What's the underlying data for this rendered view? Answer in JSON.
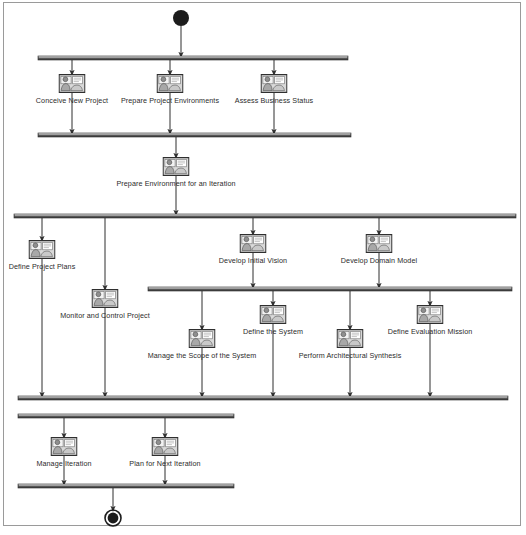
{
  "diagram": {
    "type": "uml-activity-diagram",
    "title": "",
    "colors": {
      "stroke": "#3a3a3a",
      "bar_fill": "#6e6e6e",
      "bar_highlight": "#cfcfcf",
      "node_fill": "#d6d6d6",
      "node_stroke": "#2f2f2f",
      "icon_accent": "#8f8f8f",
      "text": "#2b2b2b",
      "frame": "#9a9a9a",
      "initial_node": "#1c1c1c",
      "final_node": "#1c1c1c"
    },
    "initial_node": {
      "name": "initial-node",
      "cx": 181,
      "cy": 18,
      "r": 8
    },
    "final_node": {
      "name": "final-node",
      "cx": 113,
      "cy": 518,
      "r_outer": 8,
      "r_inner": 5.4
    },
    "bars": [
      {
        "id": "fork-1",
        "label": "fork-bar-1",
        "x1": 38,
        "x2": 348,
        "y": 56
      },
      {
        "id": "join-1",
        "label": "join-bar-1",
        "x1": 38,
        "x2": 351,
        "y": 133
      },
      {
        "id": "fork-2",
        "label": "fork-bar-2",
        "x1": 14,
        "x2": 516,
        "y": 214
      },
      {
        "id": "fork-3",
        "label": "fork-bar-3",
        "x1": 148,
        "x2": 512,
        "y": 287
      },
      {
        "id": "join-2",
        "label": "join-bar-2",
        "x1": 18,
        "x2": 508,
        "y": 396
      },
      {
        "id": "fork-4",
        "label": "fork-bar-4",
        "x1": 18,
        "x2": 234,
        "y": 414
      },
      {
        "id": "join-3",
        "label": "join-bar-3",
        "x1": 18,
        "x2": 234,
        "y": 484
      }
    ],
    "nodes": [
      {
        "id": "conceive-new-project",
        "label": "Conceive New Project",
        "cx": 72,
        "icon_y": 74,
        "label_y": 96
      },
      {
        "id": "prepare-project-environments",
        "label": "Prepare Project Environments",
        "cx": 170,
        "icon_y": 74,
        "label_y": 96
      },
      {
        "id": "assess-business-status",
        "label": "Assess Business Status",
        "cx": 274,
        "icon_y": 74,
        "label_y": 96
      },
      {
        "id": "prepare-environment-for-an-iteration",
        "label": "Prepare Environment for an Iteration",
        "cx": 176,
        "icon_y": 157,
        "label_y": 179
      },
      {
        "id": "define-project-plans",
        "label": "Define Project Plans",
        "cx": 42,
        "icon_y": 240,
        "label_y": 262
      },
      {
        "id": "develop-initial-vision",
        "label": "Develop Initial Vision",
        "cx": 253,
        "icon_y": 234,
        "label_y": 256
      },
      {
        "id": "develop-domain-model",
        "label": "Develop Domain Model",
        "cx": 379,
        "icon_y": 234,
        "label_y": 256
      },
      {
        "id": "monitor-and-control-project",
        "label": "Monitor and Control Project",
        "cx": 105,
        "icon_y": 289,
        "label_y": 311
      },
      {
        "id": "define-the-system",
        "label": "Define the System",
        "cx": 273,
        "icon_y": 305,
        "label_y": 327
      },
      {
        "id": "define-evaluation-mission",
        "label": "Define Evaluation Mission",
        "cx": 430,
        "icon_y": 305,
        "label_y": 327
      },
      {
        "id": "manage-the-scope-of-the-system",
        "label": "Manage the Scope of the System",
        "cx": 202,
        "icon_y": 329,
        "label_y": 351
      },
      {
        "id": "perform-architectural-synthesis",
        "label": "Perform Architectural Synthesis",
        "cx": 350,
        "icon_y": 329,
        "label_y": 351
      },
      {
        "id": "manage-iteration",
        "label": "Manage Iteration",
        "cx": 64,
        "icon_y": 437,
        "label_y": 459
      },
      {
        "id": "plan-for-next-iteration",
        "label": "Plan for Next Iteration",
        "cx": 165,
        "icon_y": 437,
        "label_y": 459
      }
    ],
    "edges": [
      {
        "from": "initial-node",
        "to": "fork-bar-1",
        "x": 181,
        "y1": 26,
        "y2": 55,
        "arrow": true
      },
      {
        "from": "fork-bar-1",
        "to": "conceive-new-project",
        "x": 72,
        "y1": 58,
        "y2": 73,
        "arrow": true
      },
      {
        "from": "fork-bar-1",
        "to": "prepare-project-environments",
        "x": 170,
        "y1": 58,
        "y2": 73,
        "arrow": true
      },
      {
        "from": "fork-bar-1",
        "to": "assess-business-status",
        "x": 274,
        "y1": 58,
        "y2": 73,
        "arrow": true
      },
      {
        "from": "conceive-new-project",
        "to": "join-bar-1",
        "x": 72,
        "y1": 93,
        "y2": 132,
        "arrow": true
      },
      {
        "from": "prepare-project-environments",
        "to": "join-bar-1",
        "x": 170,
        "y1": 93,
        "y2": 132,
        "arrow": true
      },
      {
        "from": "assess-business-status",
        "to": "join-bar-1",
        "x": 274,
        "y1": 93,
        "y2": 132,
        "arrow": true
      },
      {
        "from": "join-bar-1",
        "to": "prepare-environment-for-an-iteration",
        "x": 176,
        "y1": 135,
        "y2": 156,
        "arrow": true
      },
      {
        "from": "prepare-environment-for-an-iteration",
        "to": "fork-bar-2",
        "x": 176,
        "y1": 176,
        "y2": 213,
        "arrow": true
      },
      {
        "from": "fork-bar-2",
        "to": "define-project-plans",
        "x": 42,
        "y1": 216,
        "y2": 239,
        "arrow": true
      },
      {
        "from": "fork-bar-2",
        "to": "monitor-and-control-project",
        "x": 105,
        "y1": 216,
        "y2": 288,
        "arrow": true
      },
      {
        "from": "fork-bar-2",
        "to": "develop-initial-vision",
        "x": 253,
        "y1": 216,
        "y2": 233,
        "arrow": true
      },
      {
        "from": "fork-bar-2",
        "to": "develop-domain-model",
        "x": 379,
        "y1": 216,
        "y2": 233,
        "arrow": true
      },
      {
        "from": "develop-initial-vision",
        "to": "fork-bar-3",
        "x": 253,
        "y1": 253,
        "y2": 286,
        "arrow": true
      },
      {
        "from": "develop-domain-model",
        "to": "fork-bar-3",
        "x": 379,
        "y1": 253,
        "y2": 286,
        "arrow": true
      },
      {
        "from": "fork-bar-3",
        "to": "manage-the-scope-of-the-system",
        "x": 202,
        "y1": 289,
        "y2": 328,
        "arrow": true
      },
      {
        "from": "fork-bar-3",
        "to": "define-the-system",
        "x": 273,
        "y1": 289,
        "y2": 304,
        "arrow": true
      },
      {
        "from": "fork-bar-3",
        "to": "perform-architectural-synthesis",
        "x": 350,
        "y1": 289,
        "y2": 328,
        "arrow": true
      },
      {
        "from": "fork-bar-3",
        "to": "define-evaluation-mission",
        "x": 430,
        "y1": 289,
        "y2": 304,
        "arrow": true
      },
      {
        "from": "define-project-plans",
        "to": "join-bar-2",
        "x": 42,
        "y1": 259,
        "y2": 395,
        "arrow": true
      },
      {
        "from": "monitor-and-control-project",
        "to": "join-bar-2",
        "x": 105,
        "y1": 308,
        "y2": 395,
        "arrow": true
      },
      {
        "from": "manage-the-scope-of-the-system",
        "to": "join-bar-2",
        "x": 202,
        "y1": 348,
        "y2": 395,
        "arrow": true
      },
      {
        "from": "define-the-system",
        "to": "join-bar-2",
        "x": 273,
        "y1": 324,
        "y2": 395,
        "arrow": true
      },
      {
        "from": "perform-architectural-synthesis",
        "to": "join-bar-2",
        "x": 350,
        "y1": 348,
        "y2": 395,
        "arrow": true
      },
      {
        "from": "define-evaluation-mission",
        "to": "join-bar-2",
        "x": 430,
        "y1": 324,
        "y2": 395,
        "arrow": true
      },
      {
        "from": "fork-bar-4",
        "to": "manage-iteration",
        "x": 64,
        "y1": 416,
        "y2": 436,
        "arrow": true
      },
      {
        "from": "fork-bar-4",
        "to": "plan-for-next-iteration",
        "x": 165,
        "y1": 416,
        "y2": 436,
        "arrow": true
      },
      {
        "from": "manage-iteration",
        "to": "join-bar-3",
        "x": 64,
        "y1": 456,
        "y2": 483,
        "arrow": true
      },
      {
        "from": "plan-for-next-iteration",
        "to": "join-bar-3",
        "x": 165,
        "y1": 456,
        "y2": 483,
        "arrow": true
      },
      {
        "from": "join-bar-3",
        "to": "final-node",
        "x": 113,
        "y1": 486,
        "y2": 509,
        "arrow": true
      }
    ]
  }
}
